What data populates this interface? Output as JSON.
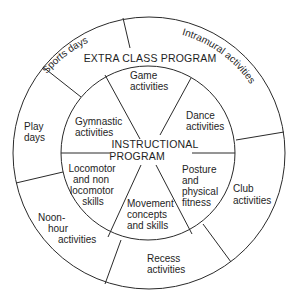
{
  "diagram": {
    "outer_ring_title": "EXTRA CLASS PROGRAM",
    "inner_title_line1": "INSTRUCTIONAL",
    "inner_title_line2": "PROGRAM",
    "outer_segments": [
      {
        "id": "sports-days",
        "label": "Sports days"
      },
      {
        "id": "intramural-activities",
        "label": "Intramural activities"
      },
      {
        "id": "club-activities",
        "lines": [
          "Club",
          "activities"
        ]
      },
      {
        "id": "recess-activities",
        "lines": [
          "Recess",
          "activities"
        ]
      },
      {
        "id": "noon-hour-activities",
        "lines": [
          "Noon-",
          "hour",
          "activities"
        ]
      },
      {
        "id": "play-days",
        "lines": [
          "Play",
          "days"
        ]
      }
    ],
    "inner_segments": [
      {
        "id": "game-activities",
        "lines": [
          "Game",
          "activities"
        ]
      },
      {
        "id": "dance-activities",
        "lines": [
          "Dance",
          "activities"
        ]
      },
      {
        "id": "posture-and-physical-fitness",
        "lines": [
          "Posture",
          "and",
          "physical",
          "fitness"
        ]
      },
      {
        "id": "movement-concepts-and-skills",
        "lines": [
          "Movement",
          "concepts",
          "and skills"
        ]
      },
      {
        "id": "locomotor-and-non-locomotor-skills",
        "lines": [
          "Locomotor",
          "and non",
          "locomotor",
          "skills"
        ]
      },
      {
        "id": "gymnastic-activities",
        "lines": [
          "Gymnastic",
          "activities"
        ]
      }
    ],
    "colors": {
      "line": "#2a2a2a",
      "text": "#1e1e1e",
      "background": "#ffffff"
    }
  }
}
